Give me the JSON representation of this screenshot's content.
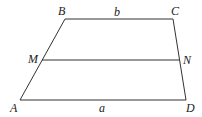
{
  "diagram": {
    "type": "trapezoid-midline",
    "vertices": {
      "A": {
        "label": "A",
        "x": 20,
        "y": 100
      },
      "B": {
        "label": "B",
        "x": 65,
        "y": 19
      },
      "C": {
        "label": "C",
        "x": 173,
        "y": 19
      },
      "D": {
        "label": "D",
        "x": 186,
        "y": 100
      },
      "M": {
        "label": "M",
        "x": 42,
        "y": 60
      },
      "N": {
        "label": "N",
        "x": 180,
        "y": 60
      }
    },
    "sides": {
      "top": {
        "label": "b"
      },
      "bottom": {
        "label": "a"
      }
    },
    "line_color": "#333333"
  }
}
